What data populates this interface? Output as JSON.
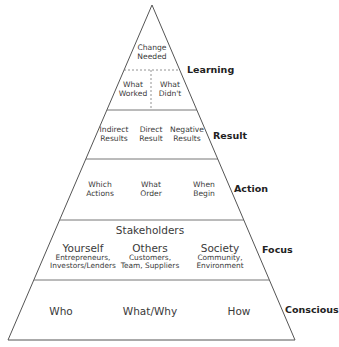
{
  "diagram": {
    "type": "pyramid",
    "levels": [
      {
        "name": "Learning",
        "cells": [
          {
            "text": "Change\nNeeded",
            "line1": "Change",
            "line2": "Needed"
          },
          {
            "line1": "What",
            "line2": "Worked"
          },
          {
            "line1": "What",
            "line2": "Didn't"
          }
        ]
      },
      {
        "name": "Result",
        "cells": [
          {
            "line1": "Indirect",
            "line2": "Results"
          },
          {
            "line1": "Direct",
            "line2": "Result"
          },
          {
            "line1": "Negative",
            "line2": "Results"
          }
        ]
      },
      {
        "name": "Action",
        "cells": [
          {
            "line1": "Which",
            "line2": "Actions"
          },
          {
            "line1": "What",
            "line2": "Order"
          },
          {
            "line1": "When",
            "line2": "Begin"
          }
        ]
      },
      {
        "name": "Focus",
        "heading": "Stakeholders",
        "cells": [
          {
            "title": "Yourself",
            "line1": "Entrepreneurs,",
            "line2": "Investors/Lenders"
          },
          {
            "title": "Others",
            "line1": "Customers,",
            "line2": "Team, Suppliers"
          },
          {
            "title": "Society",
            "line1": "Community,",
            "line2": "Environment"
          }
        ]
      },
      {
        "name": "Conscious",
        "cells": [
          {
            "title": "Who"
          },
          {
            "title": "What/Why"
          },
          {
            "title": "How"
          }
        ]
      }
    ],
    "colors": {
      "line": "#555555",
      "text": "#3a3a3a",
      "label": "#222222",
      "background": "#ffffff"
    }
  }
}
